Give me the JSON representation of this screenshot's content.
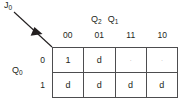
{
  "figure": {
    "kind": "karnaugh-map",
    "output_label": {
      "name": "J",
      "subscript": "0",
      "text": "J0"
    },
    "arrow": {
      "icon": "diagonal-arrow-icon",
      "points_to": "map-origin-corner"
    },
    "column_variables": [
      {
        "name": "Q",
        "subscript": "2"
      },
      {
        "name": "Q",
        "subscript": "1"
      }
    ],
    "row_variable": {
      "name": "Q",
      "subscript": "0"
    },
    "column_headers": [
      "00",
      "01",
      "11",
      "10"
    ],
    "row_headers": [
      "0",
      "1"
    ],
    "rows": [
      {
        "header": "0",
        "cells": [
          {
            "value": "1",
            "style": "normal"
          },
          {
            "value": "d",
            "style": "normal"
          },
          {
            "value": "·",
            "style": "faint"
          },
          {
            "value": "·",
            "style": "faint"
          }
        ]
      },
      {
        "header": "1",
        "cells": [
          {
            "value": "d",
            "style": "normal"
          },
          {
            "value": "d",
            "style": "normal"
          },
          {
            "value": "d",
            "style": "normal"
          },
          {
            "value": "d",
            "style": "normal"
          }
        ]
      }
    ],
    "colors": {
      "background": "#ffffff",
      "line": "#4d4d4f",
      "text": "#231f20",
      "faint_text": "#8a8a8d"
    }
  }
}
